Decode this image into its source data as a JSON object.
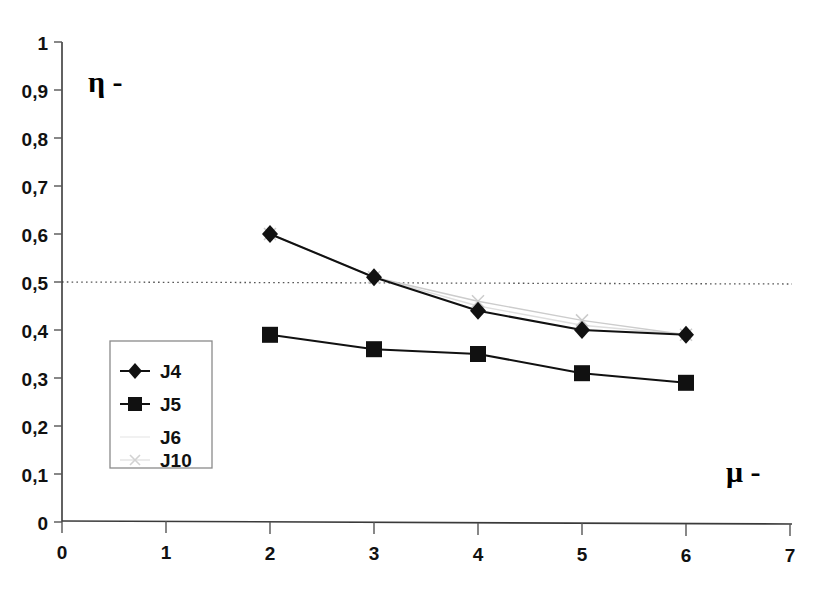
{
  "chart_data": {
    "type": "line",
    "title": "",
    "xlabel": "μ -",
    "ylabel": "η -",
    "xlim": [
      0,
      7
    ],
    "ylim": [
      0,
      1
    ],
    "x": [
      2,
      3,
      4,
      5,
      6
    ],
    "xticks": [
      "0",
      "1",
      "2",
      "3",
      "4",
      "5",
      "6",
      "7"
    ],
    "yticks": [
      "0",
      "0,1",
      "0,2",
      "0,3",
      "0,4",
      "0,5",
      "0,6",
      "0,7",
      "0,8",
      "0,9",
      "1"
    ],
    "grid": false,
    "legend_position": "inside-left",
    "reference_line": {
      "axis": "y",
      "value": 0.5,
      "style": "dotted"
    },
    "series": [
      {
        "name": "J4",
        "marker": "diamond",
        "color": "#111111",
        "values": [
          0.6,
          0.51,
          0.44,
          0.4,
          0.39
        ]
      },
      {
        "name": "J5",
        "marker": "square",
        "color": "#111111",
        "values": [
          0.39,
          0.36,
          0.35,
          0.31,
          0.29
        ]
      },
      {
        "name": "J6",
        "marker": "none",
        "color": "#dedede",
        "values": [
          0.6,
          0.51,
          0.45,
          0.41,
          0.39
        ]
      },
      {
        "name": "J10",
        "marker": "cross",
        "color": "#cccccc",
        "values": [
          0.6,
          0.51,
          0.46,
          0.42,
          0.39
        ]
      }
    ]
  },
  "legend": {
    "items": [
      {
        "label": "J4",
        "marker": "diamond"
      },
      {
        "label": "J5",
        "marker": "square"
      },
      {
        "label": "J6",
        "marker": "none"
      },
      {
        "label": "J10",
        "marker": "cross"
      }
    ]
  },
  "axes": {
    "y_axis_title": "η -",
    "x_axis_title": "μ -"
  }
}
